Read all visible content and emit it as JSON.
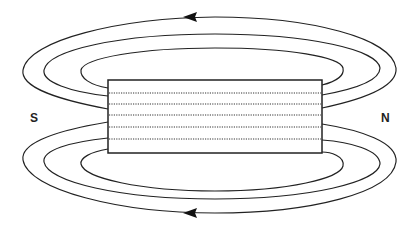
{
  "diagram": {
    "labels": {
      "south": "S",
      "north": "N"
    },
    "magnet": {
      "x": 108,
      "y": 80,
      "width": 214,
      "height": 73,
      "internal_lines": 5
    },
    "field_lines": {
      "top_count": 3,
      "bottom_count": 3,
      "arrow_direction": "left"
    },
    "colors": {
      "stroke": "#222222",
      "background": "#ffffff"
    }
  }
}
